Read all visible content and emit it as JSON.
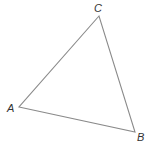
{
  "diagram": {
    "type": "triangle",
    "stroke_color": "#8a8a8a",
    "label_color": "#333333",
    "vertices": [
      {
        "name": "A",
        "x": 19,
        "y": 107,
        "label": "A",
        "label_x": 7,
        "label_y": 112
      },
      {
        "name": "B",
        "x": 135,
        "y": 132,
        "label": "B",
        "label_x": 137,
        "label_y": 141
      },
      {
        "name": "C",
        "x": 99,
        "y": 16,
        "label": "C",
        "label_x": 94,
        "label_y": 12
      }
    ]
  }
}
